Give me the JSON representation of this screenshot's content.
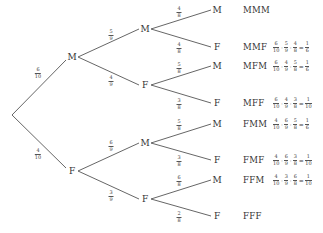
{
  "diagram": {
    "type": "probability-tree",
    "line_color": "#555555",
    "root": {
      "x": 12,
      "y": 115
    },
    "level1": [
      {
        "label": "M",
        "x": 72,
        "y": 57,
        "prob": {
          "num": "6",
          "den": "10"
        },
        "prob_pos": {
          "x": 38,
          "y": 73
        }
      },
      {
        "label": "F",
        "x": 72,
        "y": 171,
        "prob": {
          "num": "4",
          "den": "10"
        },
        "prob_pos": {
          "x": 38,
          "y": 154
        }
      }
    ],
    "level2": [
      {
        "label": "M",
        "x": 145,
        "y": 29,
        "parent": 0,
        "prob": {
          "num": "5",
          "den": "9"
        },
        "prob_pos": {
          "x": 111,
          "y": 35
        }
      },
      {
        "label": "F",
        "x": 145,
        "y": 85,
        "parent": 0,
        "prob": {
          "num": "4",
          "den": "9"
        },
        "prob_pos": {
          "x": 111,
          "y": 81
        }
      },
      {
        "label": "M",
        "x": 145,
        "y": 143,
        "parent": 1,
        "prob": {
          "num": "6",
          "den": "9"
        },
        "prob_pos": {
          "x": 111,
          "y": 146
        }
      },
      {
        "label": "F",
        "x": 145,
        "y": 199,
        "parent": 1,
        "prob": {
          "num": "3",
          "den": "9"
        },
        "prob_pos": {
          "x": 111,
          "y": 196
        }
      }
    ],
    "level3": [
      {
        "label": "M",
        "x": 217,
        "y": 10,
        "parent": 0,
        "prob": {
          "num": "4",
          "den": "8"
        },
        "prob_pos": {
          "x": 179,
          "y": 12
        }
      },
      {
        "label": "F",
        "x": 217,
        "y": 47,
        "parent": 0,
        "prob": {
          "num": "4",
          "den": "8"
        },
        "prob_pos": {
          "x": 179,
          "y": 48
        }
      },
      {
        "label": "M",
        "x": 217,
        "y": 66,
        "parent": 1,
        "prob": {
          "num": "5",
          "den": "8"
        },
        "prob_pos": {
          "x": 179,
          "y": 68
        }
      },
      {
        "label": "F",
        "x": 217,
        "y": 103,
        "parent": 1,
        "prob": {
          "num": "3",
          "den": "8"
        },
        "prob_pos": {
          "x": 179,
          "y": 104
        }
      },
      {
        "label": "M",
        "x": 217,
        "y": 124,
        "parent": 2,
        "prob": {
          "num": "5",
          "den": "8"
        },
        "prob_pos": {
          "x": 179,
          "y": 125
        }
      },
      {
        "label": "F",
        "x": 217,
        "y": 160,
        "parent": 2,
        "prob": {
          "num": "3",
          "den": "8"
        },
        "prob_pos": {
          "x": 179,
          "y": 161
        }
      },
      {
        "label": "M",
        "x": 217,
        "y": 180,
        "parent": 3,
        "prob": {
          "num": "6",
          "den": "8"
        },
        "prob_pos": {
          "x": 179,
          "y": 181
        }
      },
      {
        "label": "F",
        "x": 217,
        "y": 216,
        "parent": 3,
        "prob": {
          "num": "2",
          "den": "8"
        },
        "prob_pos": {
          "x": 179,
          "y": 217
        }
      }
    ],
    "outcomes": [
      {
        "label": "MMM",
        "y": 10,
        "calc": null
      },
      {
        "label": "MMF",
        "y": 47,
        "calc": {
          "terms": [
            [
              "6",
              "10"
            ],
            [
              "5",
              "9"
            ],
            [
              "4",
              "8"
            ]
          ],
          "result": [
            "1",
            "6"
          ]
        }
      },
      {
        "label": "MFM",
        "y": 66,
        "calc": {
          "terms": [
            [
              "6",
              "10"
            ],
            [
              "4",
              "9"
            ],
            [
              "5",
              "8"
            ]
          ],
          "result": [
            "1",
            "6"
          ]
        }
      },
      {
        "label": "MFF",
        "y": 103,
        "calc": {
          "terms": [
            [
              "6",
              "10"
            ],
            [
              "4",
              "9"
            ],
            [
              "3",
              "8"
            ]
          ],
          "result": [
            "1",
            "10"
          ]
        }
      },
      {
        "label": "FMM",
        "y": 124,
        "calc": {
          "terms": [
            [
              "4",
              "10"
            ],
            [
              "6",
              "9"
            ],
            [
              "5",
              "8"
            ]
          ],
          "result": [
            "1",
            "6"
          ]
        }
      },
      {
        "label": "FMF",
        "y": 160,
        "calc": {
          "terms": [
            [
              "4",
              "10"
            ],
            [
              "6",
              "9"
            ],
            [
              "3",
              "8"
            ]
          ],
          "result": [
            "1",
            "10"
          ]
        }
      },
      {
        "label": "FFM",
        "y": 180,
        "calc": {
          "terms": [
            [
              "4",
              "10"
            ],
            [
              "3",
              "9"
            ],
            [
              "6",
              "8"
            ]
          ],
          "result": [
            "1",
            "10"
          ]
        }
      },
      {
        "label": "FFF",
        "y": 216,
        "calc": null
      }
    ],
    "operators": {
      "times": "·",
      "equals": "="
    }
  }
}
